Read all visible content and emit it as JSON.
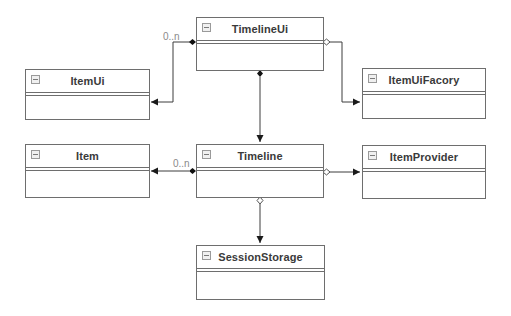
{
  "diagram": {
    "type": "UML class diagram",
    "classes": [
      {
        "id": "timelineui",
        "name": "TimelineUi",
        "x": 196,
        "y": 17,
        "w": 128,
        "h": 54
      },
      {
        "id": "itemui",
        "name": "ItemUi",
        "x": 25,
        "y": 69,
        "w": 125,
        "h": 51
      },
      {
        "id": "itemuifacory",
        "name": "ItemUiFacory",
        "x": 362,
        "y": 68,
        "w": 124,
        "h": 51
      },
      {
        "id": "item",
        "name": "Item",
        "x": 25,
        "y": 144,
        "w": 125,
        "h": 54
      },
      {
        "id": "timeline",
        "name": "Timeline",
        "x": 196,
        "y": 144,
        "w": 128,
        "h": 54
      },
      {
        "id": "itemprovider",
        "name": "ItemProvider",
        "x": 362,
        "y": 145,
        "w": 124,
        "h": 54
      },
      {
        "id": "sessionstorage",
        "name": "SessionStorage",
        "x": 196,
        "y": 245,
        "w": 129,
        "h": 55
      }
    ],
    "relationships": [
      {
        "from": "TimelineUi",
        "to": "ItemUi",
        "kind": "composition",
        "multiplicity": "0..n"
      },
      {
        "from": "TimelineUi",
        "to": "ItemUiFacory",
        "kind": "aggregation",
        "multiplicity": ""
      },
      {
        "from": "TimelineUi",
        "to": "Timeline",
        "kind": "composition",
        "multiplicity": ""
      },
      {
        "from": "Timeline",
        "to": "Item",
        "kind": "composition",
        "multiplicity": "0..n"
      },
      {
        "from": "Timeline",
        "to": "ItemProvider",
        "kind": "aggregation",
        "multiplicity": ""
      },
      {
        "from": "Timeline",
        "to": "SessionStorage",
        "kind": "aggregation",
        "multiplicity": ""
      }
    ],
    "labels": {
      "timelineui_itemui_mult": "0..n",
      "timeline_item_mult": "0..n"
    },
    "colors": {
      "line": "#3c3c3c",
      "border": "#6e6e6e",
      "text": "#3a3a3a",
      "label": "#8a8a8a",
      "background": "#ffffff"
    }
  }
}
